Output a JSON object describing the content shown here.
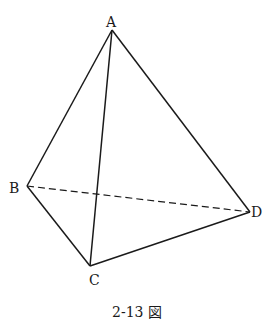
{
  "diagram": {
    "type": "tetrahedron",
    "vertices": {
      "A": {
        "label": "A",
        "x": 112,
        "y": 30
      },
      "B": {
        "label": "B",
        "x": 27,
        "y": 186
      },
      "C": {
        "label": "C",
        "x": 90,
        "y": 266
      },
      "D": {
        "label": "D",
        "x": 250,
        "y": 212
      }
    },
    "edges": [
      {
        "from": "A",
        "to": "B",
        "style": "solid"
      },
      {
        "from": "A",
        "to": "C",
        "style": "solid"
      },
      {
        "from": "A",
        "to": "D",
        "style": "solid"
      },
      {
        "from": "B",
        "to": "C",
        "style": "solid"
      },
      {
        "from": "C",
        "to": "D",
        "style": "solid"
      },
      {
        "from": "B",
        "to": "D",
        "style": "dashed"
      }
    ],
    "line_color": "#1a1a1a",
    "caption": "2-13 図"
  }
}
